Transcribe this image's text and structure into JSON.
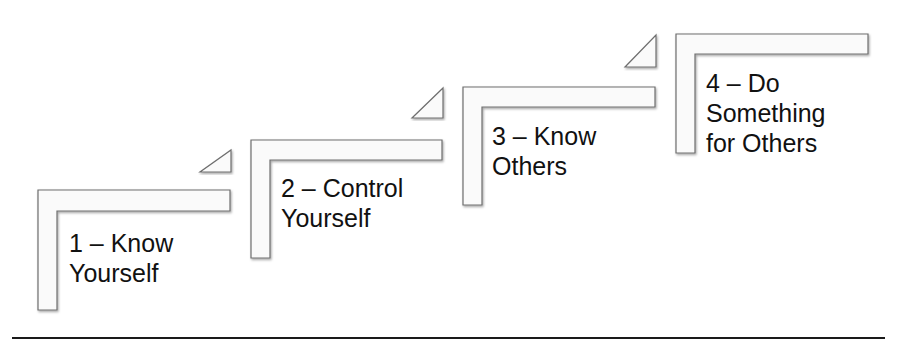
{
  "diagram": {
    "type": "staircase",
    "colors": {
      "shape_fill": "#fafafa",
      "shape_stroke": "#6e6e6e",
      "text": "#111111",
      "baseline": "#1a1a1a"
    },
    "steps": [
      {
        "number": "1",
        "line1": "1 – Know",
        "line2": "Yourself",
        "line3": ""
      },
      {
        "number": "2",
        "line1": "2 – Control",
        "line2": "Yourself",
        "line3": ""
      },
      {
        "number": "3",
        "line1": "3 – Know",
        "line2": "Others",
        "line3": ""
      },
      {
        "number": "4",
        "line1": "4 – Do",
        "line2": "Something",
        "line3": "for Others"
      }
    ]
  }
}
